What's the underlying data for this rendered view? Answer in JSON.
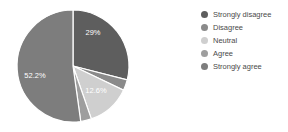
{
  "chart_data": {
    "type": "pie",
    "title": "",
    "subtitle": "",
    "xlabel": "",
    "ylabel": "",
    "legend_position": "right",
    "grid": false,
    "categories": [
      "Strongly disagree",
      "Disagree",
      "Neutral",
      "Agree",
      "Strongly agree"
    ],
    "values": [
      29.0,
      3.1,
      12.6,
      3.1,
      52.2
    ],
    "value_labels": [
      "29%",
      "",
      "12.6%",
      "",
      "52.2%"
    ],
    "colors": [
      "#5e5e5e",
      "#8a8a8a",
      "#cfcfcf",
      "#9e9e9e",
      "#7d7d7d"
    ],
    "slice_separator_color": "#ffffff",
    "visible_labels": [
      {
        "text": "29%",
        "x": 93,
        "y": 35
      },
      {
        "text": "12.6%",
        "x": 96,
        "y": 93
      },
      {
        "text": "52.2%",
        "x": 35,
        "y": 78
      }
    ]
  },
  "legend": {
    "items": [
      {
        "label": "Strongly disagree",
        "color": "#5e5e5e"
      },
      {
        "label": "Disagree",
        "color": "#8a8a8a"
      },
      {
        "label": "Neutral",
        "color": "#cfcfcf"
      },
      {
        "label": "Agree",
        "color": "#9e9e9e"
      },
      {
        "label": "Strongly agree",
        "color": "#7d7d7d"
      }
    ]
  },
  "geometry": {
    "center_x": 73,
    "center_y": 66,
    "radius": 56
  }
}
